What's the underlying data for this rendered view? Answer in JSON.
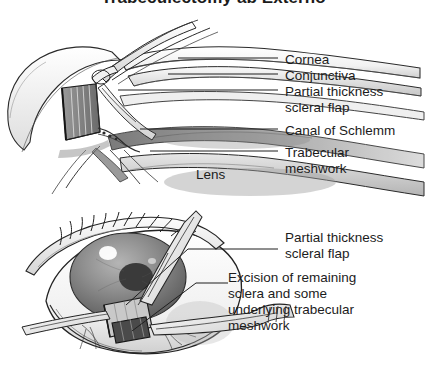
{
  "title": {
    "text": "Trabeculectomy ab Externo",
    "clipped": true
  },
  "panels": [
    {
      "id": "upper-panel",
      "name": "cross-section-view",
      "description": "Sagittal cross-section of the anterior chamber angle during trabeculectomy, with forceps and blade retracting a partial thickness scleral flap",
      "labels": [
        {
          "id": "cornea",
          "lines": [
            "Cornea"
          ]
        },
        {
          "id": "conjunctiva",
          "lines": [
            "Conjunctiva"
          ]
        },
        {
          "id": "partial-thickness-scleral-flap",
          "lines": [
            "Partial thickness",
            "scleral flap"
          ]
        },
        {
          "id": "canal-of-schlemm",
          "lines": [
            "Canal of Schlemm"
          ]
        },
        {
          "id": "trabecular-meshwork",
          "lines": [
            "Trabecular",
            "meshwork"
          ]
        }
      ],
      "inline_labels": [
        {
          "id": "lens",
          "text": "Lens"
        }
      ]
    },
    {
      "id": "lower-panel",
      "name": "frontal-view",
      "description": "Frontal surgeon's view of the eye with lid speculum, forceps and scissors excising sclera beneath the scleral flap",
      "labels": [
        {
          "id": "partial-thickness-scleral-flap-2",
          "lines": [
            "Partial thickness",
            "scleral flap"
          ]
        },
        {
          "id": "excision",
          "lines": [
            "Excision of remaining",
            "sclera and some",
            "underlying trabecular",
            "meshwork"
          ]
        }
      ]
    }
  ],
  "colors": {
    "ink": "#1c1c1c",
    "line": "#2a2a2a",
    "background": "#ffffff",
    "shade_light": "#d8d8d8",
    "shade_mid": "#a8a8a8",
    "shade_dark": "#6e6e6e",
    "iris": "#8e8e8e",
    "pupil": "#3a3a3a"
  }
}
